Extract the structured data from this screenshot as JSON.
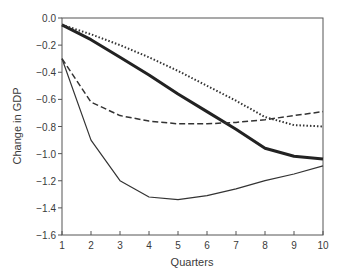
{
  "chart_data": {
    "type": "line",
    "title": "",
    "xlabel": "Quarters",
    "ylabel": "Change in GDP",
    "x": [
      1,
      2,
      3,
      4,
      5,
      6,
      7,
      8,
      9,
      10
    ],
    "xlim": [
      1,
      10
    ],
    "ylim": [
      -1.6,
      0.0
    ],
    "xticks": [
      "1",
      "2",
      "3",
      "4",
      "5",
      "6",
      "7",
      "8",
      "9",
      "10"
    ],
    "yticks": [
      "0.0",
      "-0.2",
      "-0.4",
      "-0.6",
      "-0.8",
      "-1.0",
      "-1.2",
      "-1.4",
      "-1.6"
    ],
    "ytick_values": [
      0.0,
      -0.2,
      -0.4,
      -0.6,
      -0.8,
      -1.0,
      -1.2,
      -1.4,
      -1.6
    ],
    "grid": false,
    "legend": "none",
    "series": [
      {
        "name": "thick-solid",
        "style": "solid",
        "width": 3,
        "color": "#222222",
        "values": [
          -0.05,
          -0.16,
          -0.29,
          -0.42,
          -0.56,
          -0.69,
          -0.82,
          -0.96,
          -1.02,
          -1.04
        ]
      },
      {
        "name": "dotted",
        "style": "dotted",
        "width": 2,
        "color": "#333333",
        "values": [
          -0.05,
          -0.12,
          -0.2,
          -0.29,
          -0.39,
          -0.5,
          -0.61,
          -0.73,
          -0.79,
          -0.8
        ]
      },
      {
        "name": "dashed",
        "style": "dashed",
        "width": 1.5,
        "color": "#333333",
        "values": [
          -0.3,
          -0.62,
          -0.72,
          -0.76,
          -0.78,
          -0.78,
          -0.77,
          -0.75,
          -0.72,
          -0.69
        ]
      },
      {
        "name": "thin-solid",
        "style": "solid",
        "width": 1.2,
        "color": "#333333",
        "values": [
          -0.3,
          -0.9,
          -1.2,
          -1.32,
          -1.34,
          -1.31,
          -1.26,
          -1.2,
          -1.15,
          -1.09
        ]
      }
    ]
  }
}
